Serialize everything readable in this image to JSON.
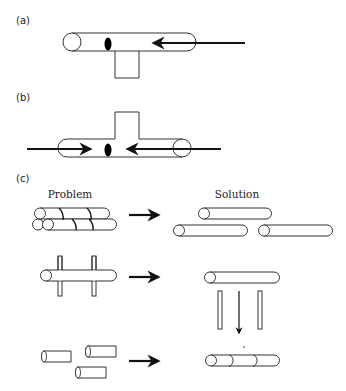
{
  "panels": {
    "a": {
      "label": "(a)"
    },
    "b": {
      "label": "(b)"
    },
    "c": {
      "label": "(c)",
      "headers": {
        "problem": "Problem",
        "solution": "Solution"
      },
      "rows": [
        {
          "problem": "bundled-overlapping-tubes",
          "solution": "separated-tubes"
        },
        {
          "problem": "tube-crossed-by-bars",
          "solution": "tube-lifted-off-bars"
        },
        {
          "problem": "scattered-short-segments",
          "solution": "joined-segments"
        }
      ]
    }
  },
  "icons": {
    "arrow": "right-arrow-icon",
    "droplet": "black-ellipse-droplet"
  },
  "colors": {
    "stroke": "#333333",
    "fill": "#000000",
    "background": "#ffffff"
  }
}
